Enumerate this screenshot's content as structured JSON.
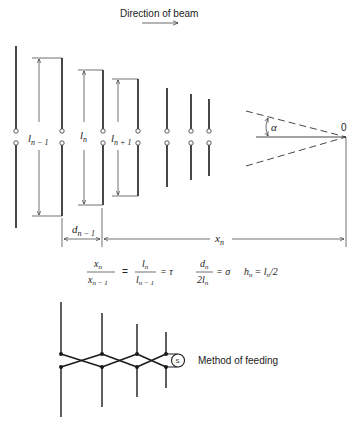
{
  "header": {
    "direction_label": "Direction of beam"
  },
  "array": {
    "element_count": 7,
    "labels": {
      "l_prev": "l",
      "l_prev_sub": "n − 1",
      "l_cur": "l",
      "l_cur_sub": "n",
      "l_next": "l",
      "l_next_sub": "n + 1",
      "d_prev": "d",
      "d_prev_sub": "n − 1",
      "x_n": "x",
      "x_n_sub": "n",
      "alpha": "α",
      "apex": "0"
    }
  },
  "equations": {
    "ratio1_num": "x",
    "ratio1_num_sub": "n",
    "ratio1_den": "x",
    "ratio1_den_sub": "n − 1",
    "ratio2_num": "l",
    "ratio2_num_sub": "n",
    "ratio2_den": "l",
    "ratio2_den_sub": "n − 1",
    "tau": "= τ",
    "equals": "=",
    "ratio3_num": "d",
    "ratio3_num_sub": "n",
    "ratio3_den": "2l",
    "ratio3_den_sub": "n",
    "sigma": "= σ",
    "h_eq_lhs": "h",
    "h_eq_lhs_sub": "n",
    "h_eq_rhs": "= l",
    "h_eq_rhs_sub": "n",
    "h_eq_tail": "/2"
  },
  "feeding": {
    "label": "Method of feeding",
    "source_symbol": "S"
  },
  "colors": {
    "ink": "#1a1a1a",
    "background": "#ffffff"
  }
}
